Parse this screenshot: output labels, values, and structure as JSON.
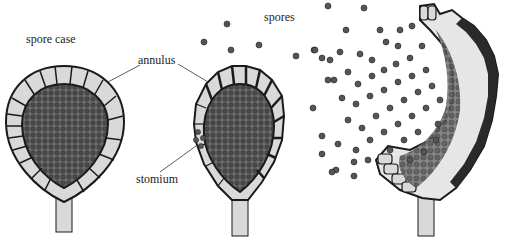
{
  "diagram": {
    "labels": {
      "spore_case": "spore case",
      "annulus": "annulus",
      "spores": "spores",
      "stomium": "stomium"
    },
    "stages": [
      {
        "name": "closed-spore-case"
      },
      {
        "name": "opening-spore-case"
      },
      {
        "name": "released-spore-case"
      }
    ],
    "colors": {
      "outline": "#1a1a1a",
      "cell_fill": "#d9d9d9",
      "spore_fill": "#555555",
      "background": "#ffffff"
    }
  }
}
